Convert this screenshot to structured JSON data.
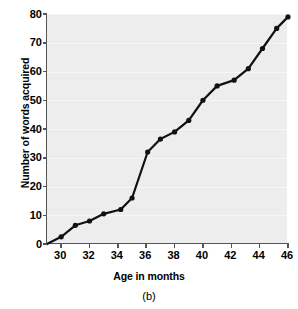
{
  "chart_data": {
    "type": "line",
    "title": "",
    "caption": "(b)",
    "xlabel": "Age in months",
    "ylabel": "Number of words acquired",
    "xlim": [
      29,
      46
    ],
    "ylim": [
      0,
      80
    ],
    "xticks": [
      30,
      32,
      34,
      36,
      38,
      40,
      42,
      44,
      46
    ],
    "yticks": [
      0,
      10,
      20,
      30,
      40,
      50,
      60,
      70,
      80
    ],
    "grid": true,
    "legend": null,
    "marker": "filled-circle",
    "line_color": "#111111",
    "plot_background": "#ededed",
    "series": [
      {
        "name": "Words acquired",
        "x": [
          29.0,
          30.0,
          31.0,
          32.0,
          33.0,
          34.2,
          35.0,
          36.1,
          37.0,
          38.0,
          39.0,
          40.0,
          41.0,
          42.2,
          43.2,
          44.2,
          45.2,
          46.0
        ],
        "values": [
          0,
          2.5,
          6.5,
          8,
          10.5,
          12,
          16,
          32,
          36.5,
          39,
          43,
          50,
          55,
          57,
          61,
          68,
          75,
          79
        ]
      }
    ],
    "points": [
      {
        "x": 29.0,
        "y": 0
      },
      {
        "x": 30.0,
        "y": 2.5
      },
      {
        "x": 31.0,
        "y": 6.5
      },
      {
        "x": 32.0,
        "y": 8
      },
      {
        "x": 33.0,
        "y": 10.5
      },
      {
        "x": 34.2,
        "y": 12
      },
      {
        "x": 35.0,
        "y": 16
      },
      {
        "x": 36.1,
        "y": 32
      },
      {
        "x": 37.0,
        "y": 36.5
      },
      {
        "x": 38.0,
        "y": 39
      },
      {
        "x": 39.0,
        "y": 43
      },
      {
        "x": 40.0,
        "y": 50
      },
      {
        "x": 41.0,
        "y": 55
      },
      {
        "x": 42.2,
        "y": 57
      },
      {
        "x": 43.2,
        "y": 61
      },
      {
        "x": 44.2,
        "y": 68
      },
      {
        "x": 45.2,
        "y": 75
      },
      {
        "x": 46.0,
        "y": 79
      }
    ]
  }
}
